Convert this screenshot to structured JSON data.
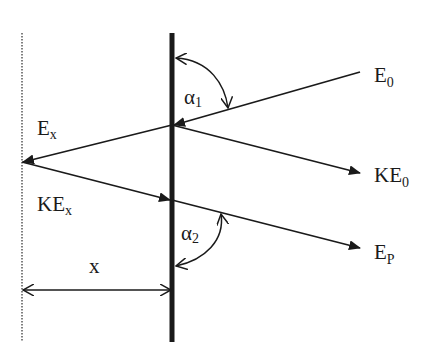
{
  "diagram": {
    "type": "ray/energy diagram",
    "colors": {
      "ink": "#1a1a1a",
      "background": "#ffffff"
    },
    "labels": {
      "e0": {
        "main": "E",
        "sub": "0"
      },
      "ke0": {
        "main": "KE",
        "sub": "0"
      },
      "ep": {
        "main": "E",
        "sub": "P"
      },
      "ex": {
        "main": "E",
        "sub": "x"
      },
      "kex": {
        "main": "KE",
        "sub": "x"
      },
      "alpha1": {
        "main": "α",
        "sub": "1"
      },
      "alpha2": {
        "main": "α",
        "sub": "2"
      },
      "distance": "x"
    },
    "elements": [
      {
        "name": "surface-line",
        "style": "thick solid vertical"
      },
      {
        "name": "reference-line",
        "style": "dotted vertical"
      },
      {
        "name": "incident-ray",
        "label": "E0",
        "direction": "toward surface"
      },
      {
        "name": "ray-to-depth",
        "label": "Ex",
        "direction": "toward reference line"
      },
      {
        "name": "emitted-ray",
        "label": "KE0",
        "direction": "away from surface"
      },
      {
        "name": "return-ray",
        "label": "KEx",
        "direction": "toward surface"
      },
      {
        "name": "exit-ray",
        "label": "EP",
        "direction": "away from surface"
      },
      {
        "name": "angle-alpha1",
        "label": "α1"
      },
      {
        "name": "angle-alpha2",
        "label": "α2"
      },
      {
        "name": "distance-dimension",
        "label": "x"
      }
    ]
  }
}
